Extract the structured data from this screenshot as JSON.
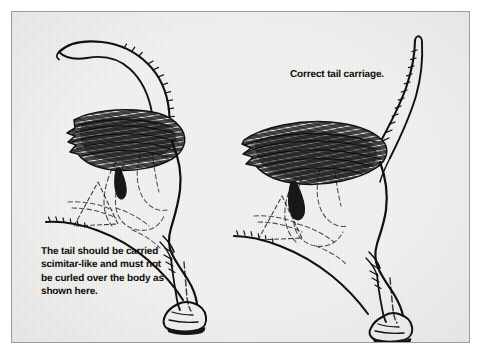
{
  "figure": {
    "kind": "scanned-book-illustration",
    "page_background": "#ffffff",
    "plate_background": "#f2f2f0",
    "plate_border_color": "#9c9c9c",
    "ink_color": "#111111",
    "text_color": "#100d0c"
  },
  "captions": {
    "incorrect": {
      "text": "The tail should be carried\nscimitar-like and must not\nbe curled over the body as\nshown here.",
      "lines": [
        "The tail should be carried",
        "scimitar-like and must not",
        "be curled over the body as",
        "shown here."
      ]
    },
    "correct": {
      "text": "Correct tail carriage.",
      "lines": [
        "Correct tail carriage."
      ]
    }
  },
  "illustrations": [
    {
      "name": "incorrect-tail-carriage",
      "position": "left",
      "description": "Rear view line drawing of a hound's hindquarters with the tail curled forward over the back"
    },
    {
      "name": "correct-tail-carriage",
      "position": "right",
      "description": "Rear view line drawing of a hound's hindquarters with the tail carried upright in a scimitar curve"
    }
  ]
}
